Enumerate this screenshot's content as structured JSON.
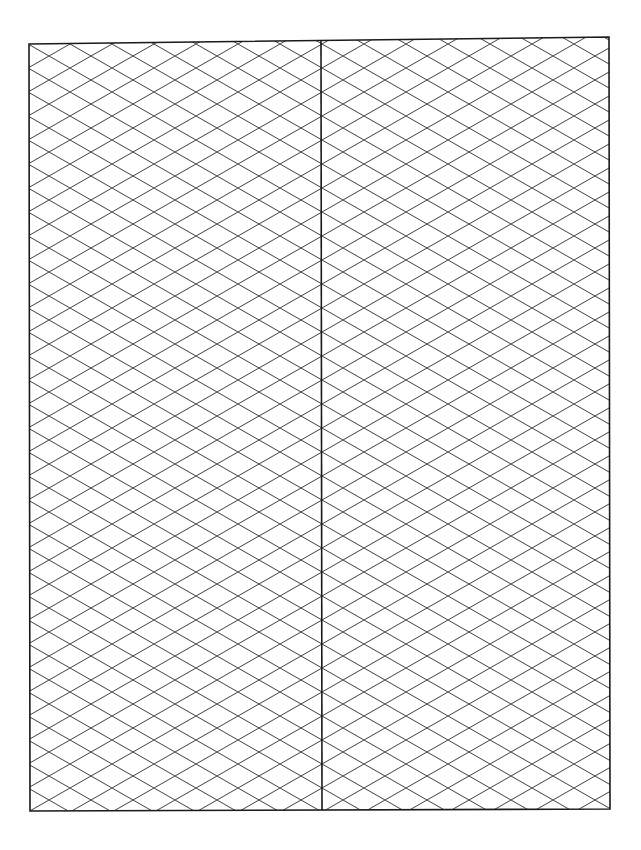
{
  "page": {
    "type": "isometric-grid-paper",
    "background": "#ffffff",
    "line_color": "#1a1a1a",
    "grid_line_color": "#2a2a2a"
  },
  "frame": {
    "left": 28,
    "top": 40,
    "right": 610,
    "bottom": 810,
    "divider_x": 322
  },
  "grid": {
    "cell_width": 42,
    "cell_height": 24,
    "panels": [
      "left-panel",
      "right-panel"
    ]
  }
}
